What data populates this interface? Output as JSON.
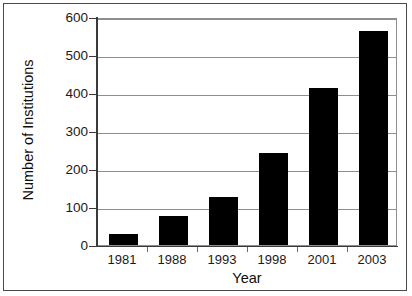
{
  "chart_data": {
    "type": "bar",
    "title": "",
    "xlabel": "Year",
    "ylabel": "Number of Institutions",
    "categories": [
      "1981",
      "1988",
      "1993",
      "1998",
      "2001",
      "2003"
    ],
    "values": [
      30,
      75,
      125,
      242,
      412,
      562
    ],
    "ylim": [
      0,
      600
    ],
    "ytick_labels": [
      "600",
      "500",
      "400",
      "300",
      "200",
      "100",
      "0"
    ],
    "ytick_values": [
      600,
      500,
      400,
      300,
      200,
      100,
      0
    ],
    "grid": "horizontal",
    "legend": "none",
    "bar_color": "#000000",
    "grid_color": "#8e8e8e",
    "axis_color": "#3a3a3a",
    "frame_color": "#4a4a4a",
    "background": "#ffffff"
  }
}
